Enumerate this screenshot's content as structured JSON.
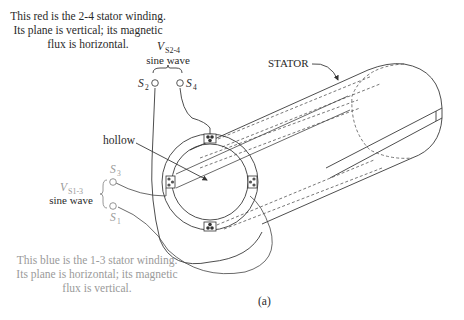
{
  "figure": {
    "caption": "(a)",
    "annotations": {
      "red_winding": {
        "line1": "This red is the 2-4 stator winding.",
        "line2": "Its plane is vertical; its magnetic",
        "line3": "flux is horizontal.",
        "color": "#2a2a2a"
      },
      "blue_winding": {
        "line1": "This blue is the 1-3 stator winding.",
        "line2": "Its plane is horizontal; its magnetic",
        "line3": "flux is vertical.",
        "color": "#9a9a9a"
      }
    },
    "sources": {
      "s24": {
        "voltage_main": "V",
        "voltage_sub": "S2-4",
        "wave": "sine wave",
        "terminal_a_main": "S",
        "terminal_a_sub": "2",
        "terminal_b_main": "S",
        "terminal_b_sub": "4"
      },
      "s13": {
        "voltage_main": "V",
        "voltage_sub": "S1-3",
        "wave": "sine wave",
        "terminal_a_main": "S",
        "terminal_a_sub": "3",
        "terminal_b_main": "S",
        "terminal_b_sub": "1"
      }
    },
    "labels": {
      "stator": "STATOR",
      "hollow": "hollow"
    }
  }
}
